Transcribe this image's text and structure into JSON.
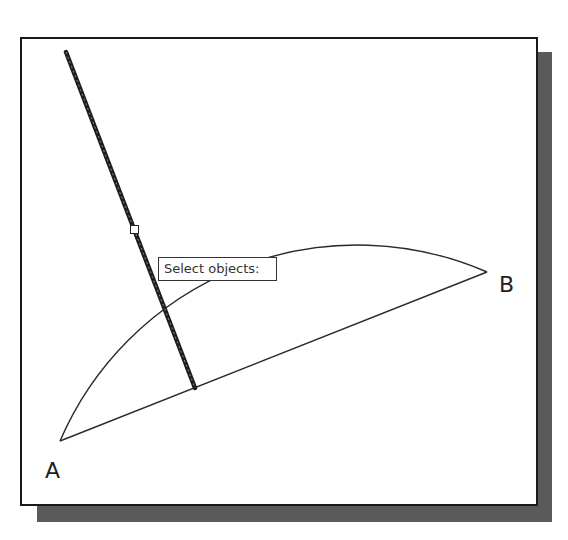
{
  "canvas": {
    "background": "#ffffff",
    "frame_color": "#1a1a1a",
    "shadow_color": "#5a5a5a"
  },
  "drawing": {
    "points": {
      "A": {
        "label": "A",
        "x": 60,
        "y": 441
      },
      "B": {
        "label": "B",
        "x": 487,
        "y": 272
      }
    },
    "chord_AB": {
      "x1": 60,
      "y1": 441,
      "x2": 487,
      "y2": 272
    },
    "arc_AB": {
      "start": [
        60,
        441
      ],
      "end": [
        487,
        272
      ],
      "radius": 324,
      "peak": [
        350,
        245
      ]
    },
    "selected_line": {
      "x1": 66,
      "y1": 52,
      "x2": 195,
      "y2": 388,
      "state": "highlighted"
    },
    "pickbox": {
      "x": 133,
      "y": 228
    }
  },
  "tooltip": {
    "text": "Select objects:"
  },
  "labels": {
    "a": "A",
    "b": "B"
  }
}
